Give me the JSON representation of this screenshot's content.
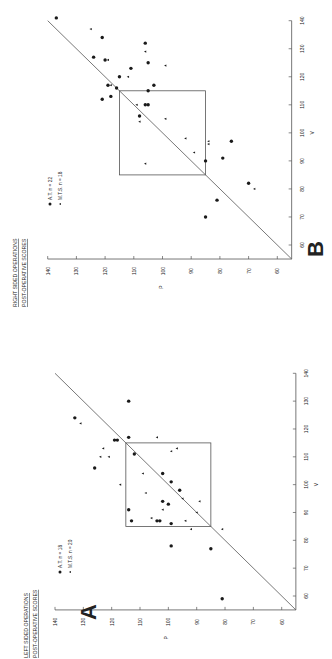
{
  "figure": {
    "colors": {
      "ink": "#1a1a1a",
      "line": "#555555",
      "background": "#ffffff"
    }
  },
  "chart_data": [
    {
      "panel": "A",
      "type": "scatter",
      "title": "LEFT SIDED OPERATIONS",
      "subtitle": "POST-OPERATIVE SCORES",
      "xlabel": "V",
      "ylabel": "P",
      "xlim": [
        55,
        140
      ],
      "ylim": [
        55,
        140
      ],
      "x_ticks": [
        60,
        70,
        80,
        90,
        100,
        110,
        120,
        130,
        140
      ],
      "y_ticks": [
        60,
        70,
        80,
        90,
        100,
        110,
        120,
        130,
        140
      ],
      "grid": false,
      "reference_line": "identity (P = V)",
      "box": {
        "x": [
          85,
          115
        ],
        "y": [
          85,
          115
        ]
      },
      "orientation": "rotated 90° counter-clockwise",
      "legend": [
        {
          "marker": "circle",
          "label": "A.T.  n = 18"
        },
        {
          "marker": "triangle",
          "label": "M.T.S.  n = 20"
        }
      ],
      "series": [
        {
          "name": "A.T.",
          "marker": "circle",
          "points": [
            [
              130,
              114
            ],
            [
              124,
              133
            ],
            [
              117,
              114
            ],
            [
              116,
              119
            ],
            [
              116,
              118
            ],
            [
              111,
              112
            ],
            [
              106,
              126
            ],
            [
              104,
              102
            ],
            [
              101,
              99
            ],
            [
              98,
              96
            ],
            [
              94,
              102
            ],
            [
              93,
              100
            ],
            [
              91,
              114
            ],
            [
              87,
              113
            ],
            [
              87,
              104
            ],
            [
              87,
              103
            ],
            [
              86,
              99
            ],
            [
              78,
              99
            ],
            [
              77,
              85
            ],
            [
              59,
              81
            ]
          ]
        },
        {
          "name": "M.T.S.",
          "marker": "triangle",
          "points": [
            [
              122,
              131
            ],
            [
              117,
              104
            ],
            [
              113,
              123
            ],
            [
              113,
              97
            ],
            [
              112,
              99
            ],
            [
              110,
              124
            ],
            [
              110,
              121
            ],
            [
              104,
              109
            ],
            [
              100,
              117
            ],
            [
              97,
              108
            ],
            [
              95,
              95
            ],
            [
              94,
              89
            ],
            [
              91,
              102
            ],
            [
              90,
              90
            ],
            [
              88,
              106
            ],
            [
              87,
              94
            ],
            [
              84,
              92
            ],
            [
              84,
              81
            ]
          ]
        }
      ]
    },
    {
      "panel": "B",
      "type": "scatter",
      "title": "RIGHT SIDED OPERATIONS",
      "subtitle": "POST-OPERATIVE SCORES",
      "xlabel": "V",
      "ylabel": "P",
      "xlim": [
        55,
        140
      ],
      "ylim": [
        55,
        140
      ],
      "x_ticks": [
        60,
        70,
        80,
        90,
        100,
        110,
        120,
        130,
        140
      ],
      "y_ticks": [
        60,
        70,
        80,
        90,
        100,
        110,
        120,
        130,
        140
      ],
      "grid": false,
      "reference_line": "identity (P = V)",
      "box": {
        "x": [
          85,
          115
        ],
        "y": [
          85,
          115
        ]
      },
      "orientation": "rotated 90° counter-clockwise",
      "legend": [
        {
          "marker": "circle",
          "label": "A.T.  n = 22"
        },
        {
          "marker": "triangle",
          "label": "M.T.S.  n = 18"
        }
      ],
      "series": [
        {
          "name": "A.T.",
          "marker": "circle",
          "points": [
            [
              141,
              137
            ],
            [
              134,
              121
            ],
            [
              132,
              106
            ],
            [
              127,
              124
            ],
            [
              126,
              120
            ],
            [
              125,
              105
            ],
            [
              123,
              111
            ],
            [
              120,
              115
            ],
            [
              117,
              103
            ],
            [
              117,
              119
            ],
            [
              116,
              116
            ],
            [
              115,
              105
            ],
            [
              113,
              118
            ],
            [
              112,
              121
            ],
            [
              110,
              106
            ],
            [
              110,
              105
            ],
            [
              106,
              108
            ],
            [
              97,
              76
            ],
            [
              91,
              79
            ],
            [
              90,
              85
            ],
            [
              82,
              70
            ],
            [
              76,
              81
            ],
            [
              70,
              85
            ]
          ]
        },
        {
          "name": "M.T.S.",
          "marker": "triangle",
          "points": [
            [
              137,
              125
            ],
            [
              129,
              106
            ],
            [
              126,
              119
            ],
            [
              124,
              99
            ],
            [
              120,
              112
            ],
            [
              117,
              118
            ],
            [
              110,
              109
            ],
            [
              104,
              108
            ],
            [
              105,
              99
            ],
            [
              98,
              92
            ],
            [
              97,
              84
            ],
            [
              96,
              84
            ],
            [
              93,
              89
            ],
            [
              89,
              106
            ],
            [
              80,
              68
            ]
          ]
        }
      ]
    }
  ],
  "labels": {
    "panel_a": "A",
    "panel_b": "B"
  }
}
